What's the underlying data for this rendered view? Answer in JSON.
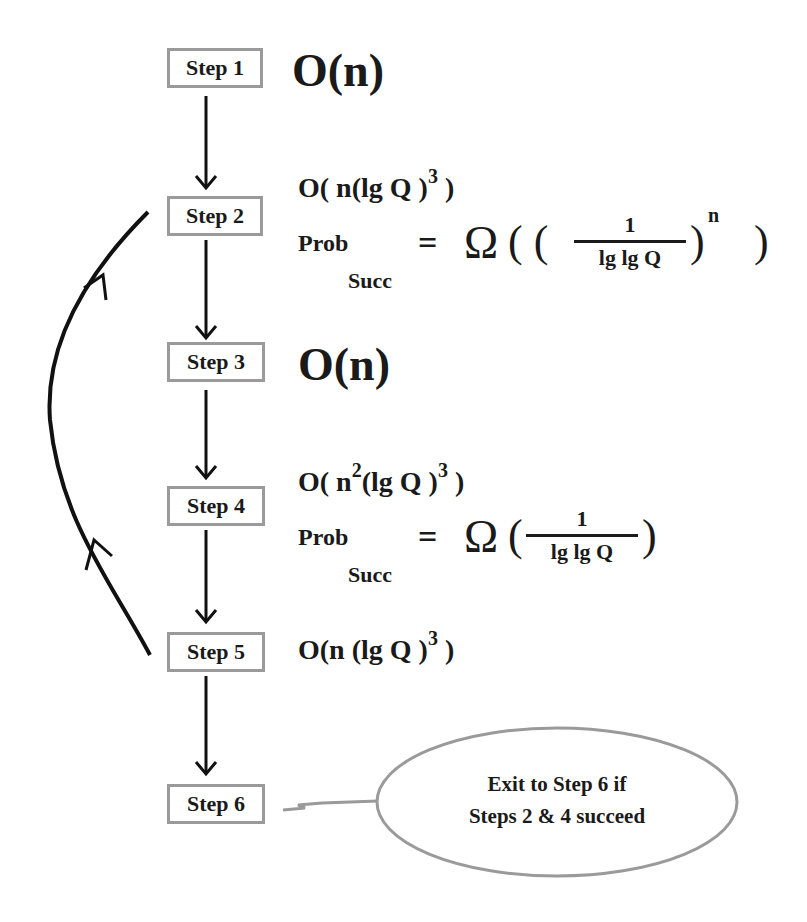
{
  "steps": [
    {
      "label": "Step 1"
    },
    {
      "label": "Step 2"
    },
    {
      "label": "Step 3"
    },
    {
      "label": "Step 4"
    },
    {
      "label": "Step 5"
    },
    {
      "label": "Step 6"
    }
  ],
  "complexities": {
    "step1": {
      "text": "O(n)"
    },
    "step2": {
      "time_prefix": "O( n(lg Q )",
      "time_exp": "3",
      "time_suffix": " )",
      "prob_label": "Prob",
      "prob_sub": "Succ",
      "equals": "=",
      "omega": "Ω",
      "open": "( (",
      "frac_num": "1",
      "frac_den": "lg lg Q",
      "close_inner": ")",
      "exp": "n",
      "close_outer": ")"
    },
    "step3": {
      "text": "O(n)"
    },
    "step4": {
      "time_prefix": "O( n",
      "time_sq": "2",
      "time_mid": "(lg Q )",
      "time_exp": "3",
      "time_suffix": " )",
      "prob_label": "Prob",
      "prob_sub": "Succ",
      "equals": "=",
      "omega": "Ω",
      "open": "(",
      "frac_num": "1",
      "frac_den": "lg lg Q",
      "close": ")"
    },
    "step5": {
      "time_prefix": "O(n (lg Q )",
      "time_exp": "3",
      "time_suffix": " )"
    }
  },
  "callout": {
    "line1_pre": "Exit to ",
    "line1_bold": "Step 6",
    "line1_post": "  if",
    "line2_bold": "Steps 2 & 4",
    "line2_post": "  succeed"
  },
  "colors": {
    "box_border": "#9a9a9a",
    "ink": "#1a1a1a",
    "callout_border": "#9a9a9a"
  }
}
